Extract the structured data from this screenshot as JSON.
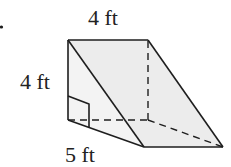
{
  "figure": {
    "type": "triangular-prism",
    "labels": {
      "top_length": "4 ft",
      "height": "4 ft",
      "base": "5 ft"
    },
    "colors": {
      "stroke": "#1e1e1e",
      "face_fill": "#ececec",
      "face_fill_light": "#f3f3f3",
      "text": "#222222"
    }
  }
}
